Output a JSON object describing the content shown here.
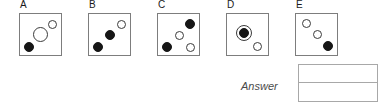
{
  "question": {
    "type": "visual-reasoning-multiple-choice",
    "options": [
      {
        "label": "A",
        "box_x": 19,
        "circles": [
          {
            "name": "open-circle-small-top-right",
            "fill": "white",
            "cx": 32,
            "cy": 10,
            "d": 9
          },
          {
            "name": "open-circle-large-center",
            "fill": "white",
            "cx": 20,
            "cy": 20,
            "d": 15
          },
          {
            "name": "filled-circle-bottom-left",
            "fill": "black",
            "cx": 9,
            "cy": 33,
            "d": 10
          }
        ]
      },
      {
        "label": "B",
        "box_x": 88,
        "circles": [
          {
            "name": "open-circle-top-right",
            "fill": "white",
            "cx": 32,
            "cy": 10,
            "d": 9
          },
          {
            "name": "filled-circle-center",
            "fill": "black",
            "cx": 21,
            "cy": 21,
            "d": 10
          },
          {
            "name": "filled-circle-bottom-left",
            "fill": "black",
            "cx": 9,
            "cy": 33,
            "d": 10
          }
        ]
      },
      {
        "label": "C",
        "box_x": 157,
        "circles": [
          {
            "name": "filled-circle-top-right",
            "fill": "black",
            "cx": 32,
            "cy": 10,
            "d": 10
          },
          {
            "name": "open-circle-center",
            "fill": "white",
            "cx": 21,
            "cy": 21,
            "d": 9
          },
          {
            "name": "filled-circle-bottom-left",
            "fill": "black",
            "cx": 9,
            "cy": 33,
            "d": 10
          },
          {
            "name": "open-circle-bottom-right",
            "fill": "white",
            "cx": 32,
            "cy": 33,
            "d": 9
          }
        ]
      },
      {
        "label": "D",
        "box_x": 226,
        "circles": [
          {
            "name": "ring-around-filled-circle-center",
            "fill": "ring",
            "cx": 17,
            "cy": 19,
            "d": 16
          },
          {
            "name": "filled-circle-center",
            "fill": "black",
            "cx": 17,
            "cy": 19,
            "d": 10
          },
          {
            "name": "open-circle-bottom-right",
            "fill": "white",
            "cx": 30,
            "cy": 32,
            "d": 9
          }
        ]
      },
      {
        "label": "E",
        "box_x": 295,
        "circles": [
          {
            "name": "open-circle-top-left",
            "fill": "white",
            "cx": 10,
            "cy": 9,
            "d": 9
          },
          {
            "name": "open-circle-center",
            "fill": "white",
            "cx": 21,
            "cy": 20,
            "d": 9
          },
          {
            "name": "filled-circle-bottom-right",
            "fill": "black",
            "cx": 32,
            "cy": 32,
            "d": 10
          }
        ]
      }
    ]
  },
  "answer": {
    "label": "Answer",
    "row_top_value": "",
    "row_bottom_value": ""
  },
  "colors": {
    "box_border": "#7d7d7d",
    "answer_border": "#a8a8a8",
    "circle_outline": "#3b3b3b",
    "circle_fill": "#161616",
    "label_text": "#1a1a1a",
    "answer_text": "#4a4a4a",
    "background": "#ffffff"
  }
}
